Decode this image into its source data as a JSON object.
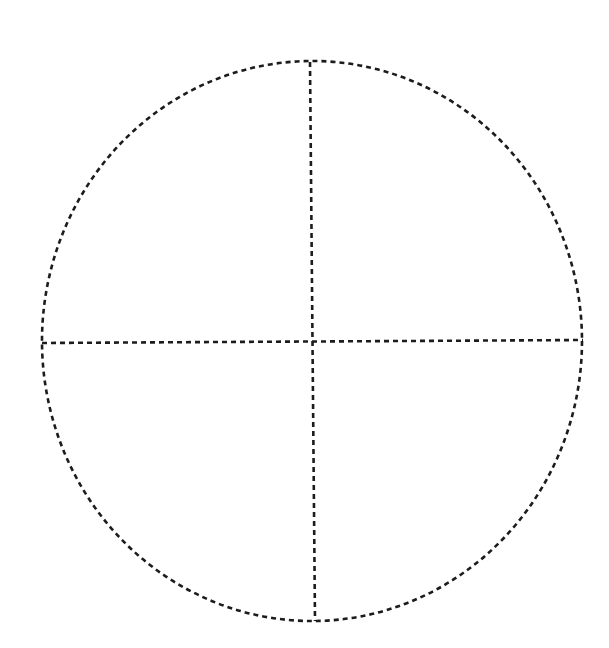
{
  "diagram": {
    "type": "circle-divided-into-quadrants",
    "style": {
      "stroke_color": "#1c1c1c",
      "background_color": "#ffffff",
      "line_style": "dashed"
    },
    "circle": {
      "cx": 312,
      "cy": 341,
      "rx": 270,
      "ry": 280
    },
    "dividers": [
      {
        "name": "vertical-diameter",
        "x1": 310,
        "y1": 62,
        "x2": 315,
        "y2": 621
      },
      {
        "name": "horizontal-diameter",
        "x1": 42,
        "y1": 343,
        "x2": 583,
        "y2": 340
      }
    ],
    "quadrants": [
      {
        "name": "top-left",
        "label": ""
      },
      {
        "name": "top-right",
        "label": ""
      },
      {
        "name": "bottom-left",
        "label": ""
      },
      {
        "name": "bottom-right",
        "label": ""
      }
    ]
  }
}
